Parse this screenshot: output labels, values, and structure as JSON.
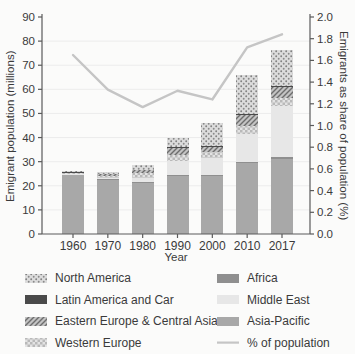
{
  "figure": {
    "background": "#fbfbfa",
    "axis_color": "#5a5a5a",
    "grid_color": "#ececec",
    "text_color": "#3a3a3a"
  },
  "chart_data": {
    "type": "bar",
    "stacked": true,
    "title": "",
    "xlabel": "Year",
    "ylabel_left": "Emigrant population (millions)",
    "ylabel_right": "Emigrants as share of population (%)",
    "ylim_left": [
      0,
      90
    ],
    "ytick_step_left": 10,
    "ylim_right": [
      0,
      2.0
    ],
    "ytick_step_right": 0.2,
    "grid": true,
    "legend_position": "bottom",
    "categories": [
      "1960",
      "1970",
      "1980",
      "1990",
      "2000",
      "2010",
      "2017"
    ],
    "series": [
      {
        "name": "Asia-Pacific",
        "style": "solid",
        "color": "#a8a8a8",
        "values": [
          24.3,
          22.6,
          21.3,
          24.0,
          24.0,
          29.4,
          31.3
        ]
      },
      {
        "name": "Africa",
        "style": "solid",
        "color": "#8f8f8f",
        "values": [
          0.2,
          0.2,
          0.3,
          0.5,
          0.4,
          0.6,
          0.7
        ]
      },
      {
        "name": "Middle East",
        "style": "solid",
        "color": "#e7e7e7",
        "values": [
          0.4,
          0.6,
          1.8,
          5.8,
          7.0,
          11.5,
          21.0
        ]
      },
      {
        "name": "Western Europe",
        "style": "checker",
        "color": "#c9c9c9",
        "values": [
          0.3,
          0.6,
          1.8,
          2.5,
          2.6,
          3.3,
          3.5
        ]
      },
      {
        "name": "Eastern Europe & Central Asia",
        "style": "diagonal",
        "color": "#9b9b9b",
        "values": [
          0.3,
          0.7,
          1.2,
          3.0,
          2.0,
          4.5,
          4.5
        ]
      },
      {
        "name": "Latin America and Car",
        "style": "solid",
        "color": "#4a4a4a",
        "values": [
          0.2,
          0.3,
          0.3,
          0.4,
          0.4,
          0.5,
          0.5
        ]
      },
      {
        "name": "North America",
        "style": "stipple",
        "color": "#bdbdbd",
        "values": [
          0.3,
          0.8,
          2.0,
          3.8,
          9.6,
          16.2,
          15.0
        ]
      }
    ],
    "line_series": {
      "name": "% of population",
      "color": "#c5c5c5",
      "axis": "right",
      "values": [
        1.65,
        1.33,
        1.17,
        1.32,
        1.24,
        1.72,
        1.84
      ]
    }
  },
  "legend": {
    "columns": [
      {
        "items": [
          "North America",
          "Latin America and Car",
          "Eastern Europe & Central Asia",
          "Western Europe"
        ]
      },
      {
        "items": [
          "Africa",
          "Middle East",
          "Asia-Pacific",
          "% of population"
        ]
      }
    ]
  }
}
